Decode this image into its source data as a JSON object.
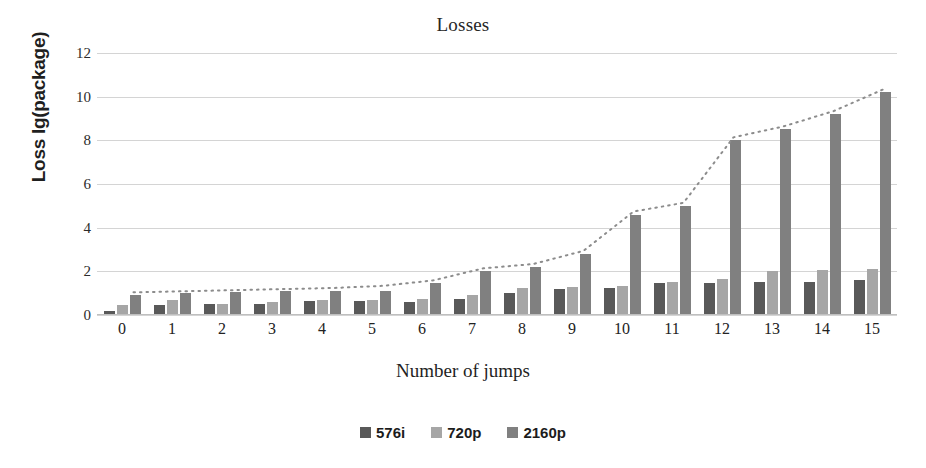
{
  "chart_data": {
    "type": "bar",
    "title": "Losses",
    "xlabel": "Number of jumps",
    "ylabel": "Loss lg(package)",
    "categories": [
      "0",
      "1",
      "2",
      "3",
      "4",
      "5",
      "6",
      "7",
      "8",
      "9",
      "10",
      "11",
      "12",
      "13",
      "14",
      "15"
    ],
    "yticks": [
      "0",
      "2",
      "4",
      "6",
      "8",
      "10",
      "12"
    ],
    "ylim": [
      0,
      12
    ],
    "grid": true,
    "legend_position": "bottom",
    "series": [
      {
        "name": "576i",
        "color": "#595959",
        "values": [
          0.2,
          0.45,
          0.5,
          0.5,
          0.65,
          0.65,
          0.6,
          0.75,
          1.0,
          1.2,
          1.25,
          1.45,
          1.45,
          1.5,
          1.5,
          1.6
        ]
      },
      {
        "name": "720p",
        "color": "#a6a6a6",
        "values": [
          0.45,
          0.7,
          0.5,
          0.6,
          0.7,
          0.7,
          0.75,
          0.9,
          1.25,
          1.3,
          1.35,
          1.5,
          1.65,
          2.0,
          2.05,
          2.1
        ]
      },
      {
        "name": "2160p",
        "color": "#808080",
        "values": [
          0.9,
          1.0,
          1.05,
          1.1,
          1.1,
          1.1,
          1.45,
          2.0,
          2.2,
          2.8,
          4.6,
          5.0,
          8.0,
          8.5,
          9.2,
          10.2
        ]
      }
    ],
    "trendline": {
      "name": "2160p-trend",
      "style": "dotted",
      "color": "#8c8c8c",
      "values": [
        0.9,
        0.95,
        1.0,
        1.05,
        1.1,
        1.2,
        1.45,
        2.0,
        2.2,
        2.8,
        4.6,
        5.0,
        8.0,
        8.5,
        9.2,
        10.2
      ]
    }
  },
  "legend": {
    "items": [
      {
        "label": "576i",
        "color": "#595959"
      },
      {
        "label": "720p",
        "color": "#a6a6a6"
      },
      {
        "label": "2160p",
        "color": "#808080"
      }
    ]
  }
}
